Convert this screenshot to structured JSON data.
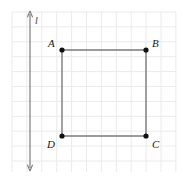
{
  "figure": {
    "background_color": "#ffffff",
    "width": 190,
    "height": 182
  },
  "grid": {
    "color": "#eceaec",
    "cell_size": 14.9,
    "columns": 11,
    "rows": 11,
    "left": 12,
    "top": 12,
    "right": 176,
    "bottom": 172,
    "visible": true
  },
  "line_l": {
    "label": "l",
    "color": "#7c7c7c",
    "x": 30,
    "y_top": 14,
    "y_bottom": 168,
    "arrow_top": true,
    "arrow_bottom": true,
    "label_x": 35,
    "label_y": 16
  },
  "shape": {
    "name": "square-abcd",
    "stroke_color": "#7a7a7a",
    "stroke_width": 1.4,
    "fill": "none",
    "vertex_color": "#111111",
    "vertex_radius": 2.6
  },
  "vertices": [
    {
      "id": "A",
      "label": "A",
      "x": 62,
      "y": 50,
      "label_x": 48,
      "label_y": 38
    },
    {
      "id": "B",
      "label": "B",
      "x": 146,
      "y": 50,
      "label_x": 152,
      "label_y": 38
    },
    {
      "id": "C",
      "label": "C",
      "x": 146,
      "y": 136,
      "label_x": 152,
      "label_y": 139
    },
    {
      "id": "D",
      "label": "D",
      "x": 62,
      "y": 136,
      "label_x": 47,
      "label_y": 139
    }
  ],
  "edges": [
    {
      "from": "A",
      "to": "B"
    },
    {
      "from": "B",
      "to": "C"
    },
    {
      "from": "C",
      "to": "D"
    },
    {
      "from": "D",
      "to": "A"
    }
  ]
}
